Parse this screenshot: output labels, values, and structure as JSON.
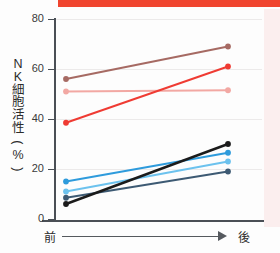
{
  "figure": {
    "top_banner_color": "#f0452f",
    "right_panel_color": "#fbeeee",
    "background_color": "#fdfdfd",
    "axis_color": "#4a4f55",
    "grid_color": "#eceaea"
  },
  "axis": {
    "y_label_chars": [
      "N",
      "K",
      "細",
      "胞",
      "活",
      "性",
      "(",
      "%",
      ")"
    ],
    "y_label_text": "NK細胞活性(%)",
    "y_ticks": [
      "80",
      "60",
      "40",
      "20",
      "0"
    ],
    "x_left_label": "前",
    "x_right_label": "後",
    "arrow_name": "progress-arrow"
  },
  "chart_data": {
    "type": "line",
    "xlabel": "",
    "ylabel": "NK細胞活性(%)",
    "categories": [
      "前",
      "後"
    ],
    "x": [
      0,
      1
    ],
    "ylim": [
      0,
      80
    ],
    "yticks": [
      0,
      20,
      40,
      60,
      80
    ],
    "grid": true,
    "legend": "none",
    "series": [
      {
        "name": "subject-1",
        "color": "#a66a63",
        "marker": "circle",
        "values": [
          56.0,
          69.0
        ]
      },
      {
        "name": "subject-2",
        "color": "#f2a8a3",
        "marker": "circle",
        "values": [
          51.0,
          51.5
        ]
      },
      {
        "name": "subject-3",
        "color": "#ef3b33",
        "marker": "circle",
        "values": [
          38.5,
          61.0
        ]
      },
      {
        "name": "subject-4",
        "color": "#2e9bdc",
        "marker": "circle",
        "values": [
          15.0,
          26.5
        ]
      },
      {
        "name": "subject-5",
        "color": "#6cc2ee",
        "marker": "circle",
        "values": [
          11.0,
          23.0
        ]
      },
      {
        "name": "subject-6",
        "color": "#3d5a73",
        "marker": "circle",
        "values": [
          8.5,
          19.0
        ]
      },
      {
        "name": "subject-7",
        "color": "#1b1b1b",
        "marker": "circle",
        "values": [
          6.0,
          30.0
        ]
      }
    ]
  }
}
